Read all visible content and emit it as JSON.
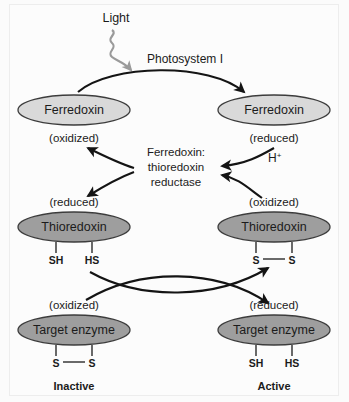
{
  "figure": {
    "light_label": "Light",
    "photosystem_label": "Photosystem I",
    "enzyme_label_line1": "Ferredoxin:",
    "enzyme_label_line2": "thioredoxin",
    "enzyme_label_line3": "reductase",
    "proton_label": "H",
    "proton_superscript": "+",
    "colors": {
      "ferredoxin_fill": "#d9d9d9",
      "thioredoxin_fill": "#9e9e9e",
      "target_enzyme_fill": "#9e9e9e",
      "node_stroke": "#3c3c3c",
      "arrow": "#141414",
      "light_arrow": "#9a9a9a",
      "background": "#fcfcfc",
      "text": "#1b1b1b"
    },
    "nodes": {
      "ferredoxin_oxidized": {
        "name": "Ferredoxin",
        "state": "(oxidized)",
        "state_position": "below"
      },
      "ferredoxin_reduced": {
        "name": "Ferredoxin",
        "state": "(reduced)",
        "state_position": "below"
      },
      "thioredoxin_reduced": {
        "name": "Thioredoxin",
        "state": "(reduced)",
        "state_position": "above",
        "bond_left": "SH",
        "bond_right": "HS",
        "bond_type": "dithiol"
      },
      "thioredoxin_oxidized": {
        "name": "Thioredoxin",
        "state": "(oxidized)",
        "state_position": "above",
        "bond_left": "S",
        "bond_right": "S",
        "bond_type": "disulfide"
      },
      "target_enzyme_inactive": {
        "name": "Target enzyme",
        "state": "(oxidized)",
        "state_position": "above",
        "bond_left": "S",
        "bond_right": "S",
        "bond_type": "disulfide",
        "status": "Inactive"
      },
      "target_enzyme_active": {
        "name": "Target enzyme",
        "state": "(reduced)",
        "state_position": "above",
        "bond_left": "SH",
        "bond_right": "HS",
        "bond_type": "dithiol",
        "status": "Active"
      }
    }
  }
}
